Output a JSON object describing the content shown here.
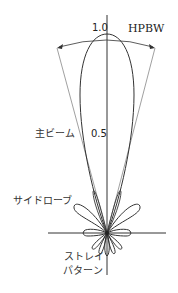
{
  "diagram": {
    "type": "antenna-radiation-pattern",
    "labels": {
      "peak_value": "1.0",
      "half_value": "0.5",
      "hpbw": "HPBW",
      "main_beam": "主ビーム",
      "side_lobe": "サイドローブ",
      "stray_line1": "ストレイ",
      "stray_line2": "パターン"
    },
    "colors": {
      "stroke": "#333333",
      "thin_stroke": "#888888",
      "background": "#ffffff"
    }
  }
}
